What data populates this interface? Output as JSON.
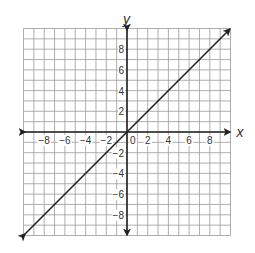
{
  "chart_data": {
    "type": "line",
    "title": "",
    "xlabel": "x",
    "ylabel": "y",
    "xlim": [
      -10,
      10
    ],
    "ylim": [
      -10,
      10
    ],
    "grid": true,
    "grid_step": 1,
    "x_ticks": [
      -8,
      -6,
      -4,
      -2,
      0,
      2,
      4,
      6,
      8
    ],
    "y_ticks": [
      8,
      6,
      4,
      2,
      -2,
      -4,
      -6,
      -8
    ],
    "x_tick_labels": [
      "−8",
      "−6",
      "−4",
      "−2",
      "0",
      "2",
      "4",
      "6",
      "8"
    ],
    "y_tick_labels": [
      "8",
      "6",
      "4",
      "2",
      "−2",
      "−4",
      "−6",
      "−8"
    ],
    "series": [
      {
        "name": "y = x",
        "equation": "y = x",
        "slope": 1,
        "intercept": 0,
        "x": [
          -10,
          10
        ],
        "y": [
          -10,
          10
        ],
        "arrows_both_ends": true
      }
    ],
    "legend": null
  },
  "colors": {
    "grid": "#9a9a9a",
    "axis": "#222222",
    "line": "#222222",
    "text": "#333333"
  }
}
